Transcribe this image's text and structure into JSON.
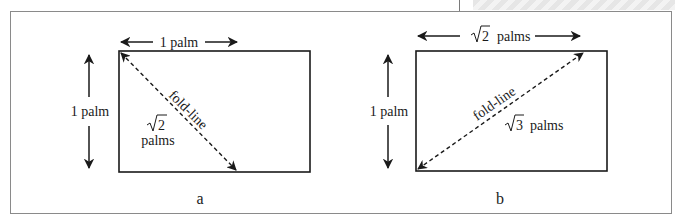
{
  "figure": {
    "panels": [
      {
        "id": "a",
        "caption": "a",
        "width_label": "1 palm",
        "height_label": "1 palm",
        "diagonal_label": "fold-line",
        "diagonal_value_root": "2",
        "diagonal_value_unit": "palms",
        "diagonal_direction": "top-left to bottom-center"
      },
      {
        "id": "b",
        "caption": "b",
        "width_label_root": "2",
        "width_label_unit": "palms",
        "height_label": "1 palm",
        "diagonal_label": "fold-line",
        "diagonal_value_root": "3",
        "diagonal_value_unit": "palms",
        "diagonal_direction": "bottom-left to top-right"
      }
    ],
    "colors": {
      "line": "#1a1a1a",
      "frame": "#8a8a8a",
      "background": "#ffffff"
    }
  }
}
